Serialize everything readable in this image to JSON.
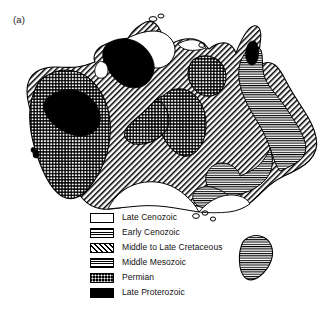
{
  "figure": {
    "panel_label": "(a)",
    "background_color": "#ffffff",
    "line_color": "#000000"
  },
  "legend": {
    "position": "bottom-center",
    "items": [
      {
        "label": "Late Cenozoic",
        "pattern": "blank",
        "swatch_class": "sw-blank",
        "fill": "#ffffff"
      },
      {
        "label": "Early Cenozoic",
        "pattern": "horizontal-lines",
        "swatch_class": "sw-horiz",
        "fill": "#ffffff"
      },
      {
        "label": "Middle to Late Cretaceous",
        "pattern": "diagonal-hatch",
        "swatch_class": "sw-diag",
        "fill": "#ffffff"
      },
      {
        "label": "Middle Mesozoic",
        "pattern": "horizontal-lines-dense",
        "swatch_class": "sw-horiz2",
        "fill": "#ffffff"
      },
      {
        "label": "Permian",
        "pattern": "checkerboard",
        "swatch_class": "sw-check",
        "fill": "#000000"
      },
      {
        "label": "Late Proterozoic",
        "pattern": "solid-black",
        "swatch_class": "sw-solid",
        "fill": "#000000"
      }
    ]
  },
  "map_regions": [
    {
      "name": "continent-outline",
      "unit": "Middle to Late Cretaceous"
    },
    {
      "name": "western-permian-block",
      "unit": "Permian"
    },
    {
      "name": "central-permian-lobe",
      "unit": "Permian"
    },
    {
      "name": "northeast-permian-patch",
      "unit": "Permian"
    },
    {
      "name": "northern-proterozoic-block",
      "unit": "Late Proterozoic"
    },
    {
      "name": "western-proterozoic-block",
      "unit": "Late Proterozoic"
    },
    {
      "name": "cape-york-proterozoic-sliver",
      "unit": "Late Proterozoic"
    },
    {
      "name": "eastern-mesozoic-belt",
      "unit": "Middle Mesozoic"
    },
    {
      "name": "southeast-mesozoic-belt",
      "unit": "Middle Mesozoic"
    },
    {
      "name": "tasmania",
      "unit": "Middle Mesozoic"
    },
    {
      "name": "southern-late-cenozoic-basin",
      "unit": "Late Cenozoic"
    },
    {
      "name": "north-coast-late-cenozoic",
      "unit": "Late Cenozoic"
    },
    {
      "name": "southeast-late-cenozoic",
      "unit": "Late Cenozoic"
    }
  ]
}
